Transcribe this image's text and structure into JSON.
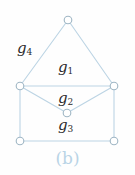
{
  "figure": {
    "caption": "(b)",
    "background_color": "#fefefe",
    "edge_color": "#bcd4e4",
    "node_stroke_color": "#9fb6c4",
    "node_fill_color": "#ffffff",
    "label_color": "#2b2b2b",
    "caption_color": "#b9d4e6"
  },
  "region_labels": [
    {
      "name": "g4",
      "base": "g",
      "sub": "4"
    },
    {
      "name": "g1",
      "base": "g",
      "sub": "1"
    },
    {
      "name": "g2",
      "base": "g",
      "sub": "2"
    },
    {
      "name": "g3",
      "base": "g",
      "sub": "3"
    }
  ],
  "graph": {
    "nodes": [
      {
        "id": "top",
        "cx": 68,
        "cy": 20,
        "r": 4
      },
      {
        "id": "mid-left",
        "cx": 20,
        "cy": 86,
        "r": 4
      },
      {
        "id": "mid-right",
        "cx": 114,
        "cy": 86,
        "r": 4
      },
      {
        "id": "center",
        "cx": 67,
        "cy": 113,
        "r": 4
      },
      {
        "id": "bottom-left",
        "cx": 20,
        "cy": 141,
        "r": 4
      },
      {
        "id": "bottom-right",
        "cx": 114,
        "cy": 141,
        "r": 4
      }
    ],
    "edges": [
      {
        "from": "top",
        "to": "mid-left"
      },
      {
        "from": "top",
        "to": "mid-right"
      },
      {
        "from": "mid-left",
        "to": "mid-right"
      },
      {
        "from": "mid-left",
        "to": "center"
      },
      {
        "from": "mid-right",
        "to": "center"
      },
      {
        "from": "mid-left",
        "to": "bottom-left"
      },
      {
        "from": "mid-right",
        "to": "bottom-right"
      },
      {
        "from": "bottom-left",
        "to": "bottom-right"
      }
    ]
  }
}
